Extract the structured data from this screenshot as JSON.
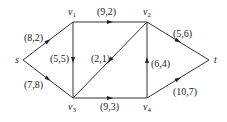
{
  "graph": {
    "type": "flow-network",
    "nodes": [
      {
        "id": "s",
        "label": "s",
        "sub": "",
        "x": 23,
        "y": 60,
        "lx": 15,
        "ly": 63
      },
      {
        "id": "v1",
        "label": "v",
        "sub": "1",
        "x": 73,
        "y": 22,
        "lx": 68,
        "ly": 15
      },
      {
        "id": "v2",
        "label": "v",
        "sub": "2",
        "x": 147,
        "y": 22,
        "lx": 143,
        "ly": 15
      },
      {
        "id": "v3",
        "label": "v",
        "sub": "3",
        "x": 73,
        "y": 98,
        "lx": 68,
        "ly": 110
      },
      {
        "id": "v4",
        "label": "v",
        "sub": "4",
        "x": 147,
        "y": 98,
        "lx": 143,
        "ly": 110
      },
      {
        "id": "t",
        "label": "t",
        "sub": "",
        "x": 209,
        "y": 60,
        "lx": 214,
        "ly": 63
      }
    ],
    "edges": [
      {
        "from": "s",
        "to": "v1",
        "label": "(8,2)",
        "lx": 24,
        "ly": 41
      },
      {
        "from": "s",
        "to": "v3",
        "label": "(7,8)",
        "lx": 24,
        "ly": 88
      },
      {
        "from": "v1",
        "to": "v2",
        "label": "(9,2)",
        "lx": 97,
        "ly": 15
      },
      {
        "from": "v1",
        "to": "v3",
        "label": "(5,5)",
        "lx": 50,
        "ly": 62
      },
      {
        "from": "v2",
        "to": "v3",
        "label": "(2,1)",
        "lx": 91,
        "ly": 62
      },
      {
        "from": "v2",
        "to": "t",
        "label": "(5,6)",
        "lx": 173,
        "ly": 37
      },
      {
        "from": "v3",
        "to": "v4",
        "label": "(9,3)",
        "lx": 100,
        "ly": 110
      },
      {
        "from": "v4",
        "to": "v2",
        "label": "(6,4)",
        "lx": 151,
        "ly": 67
      },
      {
        "from": "v4",
        "to": "t",
        "label": "(10,7)",
        "lx": 173,
        "ly": 95
      }
    ]
  },
  "colors": {
    "edge": "#333333",
    "text": "#222222",
    "background": "#ffffff"
  }
}
